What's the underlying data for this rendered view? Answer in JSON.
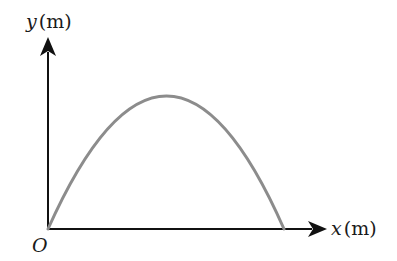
{
  "diagram": {
    "y_axis": {
      "variable": "y",
      "unit": "(m)"
    },
    "x_axis": {
      "variable": "x",
      "unit": "(m)"
    },
    "origin_label": "O",
    "curve": {
      "shape": "parabola",
      "color": "#8c8c8c"
    },
    "axis_color": "#111111"
  }
}
